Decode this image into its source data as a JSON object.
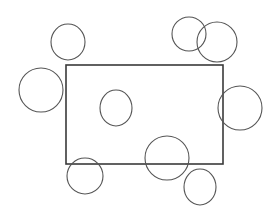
{
  "canvas": {
    "width": 279,
    "height": 217,
    "background": "#ffffff"
  },
  "rectangle": {
    "x": 66,
    "y": 65,
    "width": 157,
    "height": 99,
    "stroke": "#3a3a3a",
    "stroke_width": 1.6
  },
  "circles": [
    {
      "id": "circle-top-left",
      "cx": 68,
      "cy": 42,
      "rx": 17,
      "ry": 18,
      "stroke": "#555555"
    },
    {
      "id": "circle-left",
      "cx": 41,
      "cy": 90,
      "rx": 22,
      "ry": 22,
      "stroke": "#555555"
    },
    {
      "id": "circle-top-right-a",
      "cx": 189,
      "cy": 34,
      "rx": 17,
      "ry": 17,
      "stroke": "#555555"
    },
    {
      "id": "circle-top-right-b",
      "cx": 217,
      "cy": 42,
      "rx": 20,
      "ry": 20,
      "stroke": "#555555"
    },
    {
      "id": "circle-right-edge",
      "cx": 240,
      "cy": 108,
      "rx": 22,
      "ry": 22,
      "stroke": "#555555"
    },
    {
      "id": "circle-inside",
      "cx": 116,
      "cy": 108,
      "rx": 16,
      "ry": 18,
      "stroke": "#555555"
    },
    {
      "id": "circle-bottom-center",
      "cx": 167,
      "cy": 158,
      "rx": 22,
      "ry": 22,
      "stroke": "#555555"
    },
    {
      "id": "circle-bottom-left",
      "cx": 85,
      "cy": 176,
      "rx": 18,
      "ry": 18,
      "stroke": "#555555"
    },
    {
      "id": "circle-bottom-right",
      "cx": 200,
      "cy": 187,
      "rx": 16,
      "ry": 18,
      "stroke": "#555555"
    }
  ],
  "circle_stroke_width": 1.1
}
